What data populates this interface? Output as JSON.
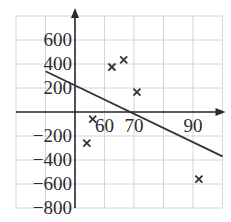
{
  "chart_data": {
    "type": "scatter",
    "title": "",
    "xlabel": "",
    "ylabel": "",
    "xlim": [
      30,
      100
    ],
    "ylim": [
      -800,
      800
    ],
    "grid": true,
    "x_tick_labels": [
      "60",
      "70",
      "90"
    ],
    "x_tick_values": [
      60,
      70,
      90
    ],
    "y_tick_labels": [
      "600",
      "400",
      "200",
      "−200",
      "−400",
      "−600",
      "−800"
    ],
    "y_tick_values": [
      600,
      400,
      200,
      -200,
      -400,
      -600,
      -800
    ],
    "series": [
      {
        "name": "data points",
        "marker": "x",
        "points": [
          {
            "x": 54,
            "y": -260
          },
          {
            "x": 56,
            "y": -60
          },
          {
            "x": 62.5,
            "y": 375
          },
          {
            "x": 66.5,
            "y": 435
          },
          {
            "x": 71,
            "y": 165
          },
          {
            "x": 92,
            "y": -560
          }
        ]
      },
      {
        "name": "trend line",
        "type": "line",
        "points": [
          {
            "x": 40,
            "y": 340
          },
          {
            "x": 100,
            "y": -370
          }
        ]
      }
    ],
    "colors": {
      "grid": "#d4d4d4",
      "axis": "#2a2a2a",
      "marks": "#333333"
    }
  }
}
